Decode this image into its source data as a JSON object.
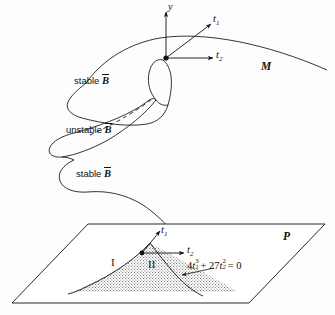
{
  "figure": {
    "background_color": "#fdfdfd",
    "line_color": "#111111",
    "stipple_color": "#4a4a4a"
  },
  "surface": {
    "name_label": "M",
    "branches": [
      {
        "id": "upper",
        "label_prefix": "stable",
        "label_symbol": "B"
      },
      {
        "id": "middle",
        "label_prefix": "unstable",
        "label_symbol": "B"
      },
      {
        "id": "lower",
        "label_prefix": "stable",
        "label_symbol": "B"
      }
    ]
  },
  "axes_surface": {
    "vertical": "y",
    "diagonal": "t",
    "diagonal_sub": "1",
    "horizontal": "t",
    "horizontal_sub": "2"
  },
  "plane": {
    "name_label": "P",
    "axes": {
      "diagonal": "t",
      "diagonal_sub": "1",
      "horizontal": "t",
      "horizontal_sub": "2"
    },
    "regions": [
      {
        "id": "region-one",
        "label": "I"
      },
      {
        "id": "region-two",
        "label": "II"
      }
    ],
    "bifurcation_equation": {
      "coefficient_1": "4",
      "var_1": "t",
      "sub_1": "1",
      "sup_1": "3",
      "operator": "+",
      "coefficient_2": "27",
      "var_2": "t",
      "sub_2": "2",
      "sup_2": "2",
      "equals": "=",
      "rhs": "0"
    }
  }
}
